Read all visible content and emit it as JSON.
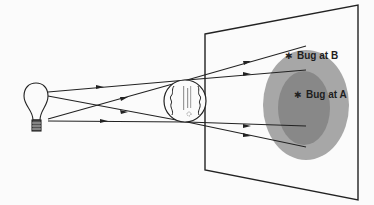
{
  "diagram": {
    "type": "optics-illustration",
    "colors": {
      "line": "#222222",
      "outer_shadow": "#a7a7a7",
      "inner_shadow": "#888888",
      "background": "#fbfbfb"
    },
    "light_source": {
      "name": "light-bulb",
      "x": 35,
      "y": 95
    },
    "occluder": {
      "name": "lens-disc",
      "cx": 185,
      "cy": 101,
      "r": 21
    },
    "screen": {
      "corners": [
        [
          205,
          34
        ],
        [
          358,
          5
        ],
        [
          358,
          200
        ],
        [
          205,
          170
        ]
      ]
    },
    "shadows": [
      {
        "name": "outer-shadow-region",
        "cx": 306,
        "cy": 105,
        "rx": 43,
        "ry": 55
      },
      {
        "name": "inner-shadow-region",
        "cx": 305,
        "cy": 106,
        "rx": 27,
        "ry": 38
      }
    ],
    "rays": [
      {
        "from": [
          47,
          91
        ],
        "to": [
          306,
          47
        ]
      },
      {
        "from": [
          47,
          91
        ],
        "to": [
          306,
          70
        ]
      },
      {
        "from": [
          47,
          118
        ],
        "to": [
          306,
          148
        ]
      },
      {
        "from": [
          47,
          120
        ],
        "to": [
          306,
          126
        ]
      }
    ],
    "labels": {
      "bug_b": "Bug at B",
      "bug_a": "Bug at A"
    }
  }
}
